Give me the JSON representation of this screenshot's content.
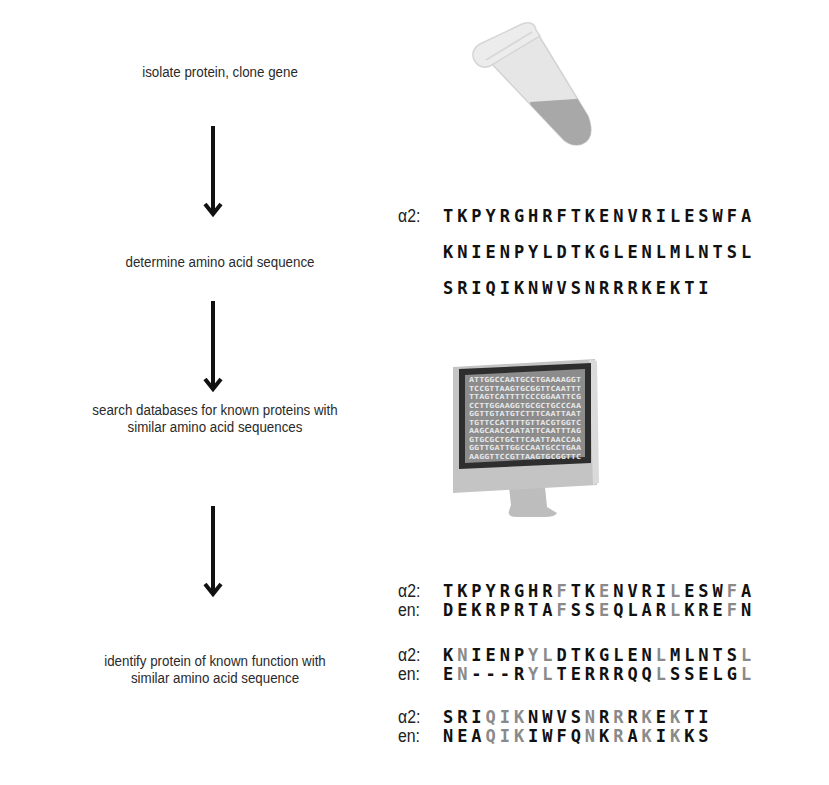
{
  "steps": [
    {
      "label_lines": [
        "isolate protein, clone gene"
      ]
    },
    {
      "label_lines": [
        "determine amino acid sequence"
      ]
    },
    {
      "label_lines": [
        "search databases for known proteins with",
        "similar amino acid sequences"
      ]
    },
    {
      "label_lines": [
        "identify protein of known function with",
        "similar amino acid sequence"
      ]
    }
  ],
  "illustrations": {
    "tube": "microcentrifuge-tube",
    "computer": "desktop-monitor",
    "screen_dna": [
      "ATTGGCCAATGCCTGAAAAGGT",
      "TCCGTTAAGTGCGGTTCAATTT",
      "TTAGTCATTTTCCCGGAATTCG",
      "CCTTGGAAGGTGCGCTGCCCAA",
      "GGTTGTATGTCTTTCAATTAAT",
      "TGTTCCATTTTGTTACGTGGTC",
      "AAGCAACCAATATTCAATTTAG",
      "GTGCGCTGCTTCAATTAACCAA",
      "GGTTGATTGGCCAATGCCTGAA",
      "AAGGTTCCGTTAAGTGCGGTTC"
    ]
  },
  "sequence": {
    "prefix": "α2:",
    "lines": [
      "TKPYRGHRFTKENVRILESWFA",
      "KNIENPYLDTKGLENLMLNTSL",
      "SRIQIKNWVSNRRRKEKTI"
    ]
  },
  "alignment": {
    "colors": {
      "identical": "#8a8a8a",
      "different": "#111111"
    },
    "blocks": [
      {
        "a2": {
          "prefix": "α2:",
          "seq": "TKPYRGHRFTKENVRILESWFA"
        },
        "en": {
          "prefix": "en:",
          "seq": "DEKRPRTAFSSEQLARLKREFN"
        },
        "match_positions": [
          8,
          11,
          16,
          20
        ]
      },
      {
        "a2": {
          "prefix": "α2:",
          "seq": "KNIENPYLDTKGLENLMLNTSL"
        },
        "en": {
          "prefix": "en:",
          "seq": "EN---RYLTERRRQQLSSELGL"
        },
        "match_positions": [
          1,
          6,
          7,
          15,
          21
        ]
      },
      {
        "a2": {
          "prefix": "α2:",
          "seq": "SRIQIKNWVSNRRRKEKTI"
        },
        "en": {
          "prefix": "en:",
          "seq": "NEAQIKIWFQNKRAKIKKS"
        },
        "match_positions": [
          3,
          4,
          5,
          10,
          12,
          14,
          16
        ]
      }
    ]
  }
}
